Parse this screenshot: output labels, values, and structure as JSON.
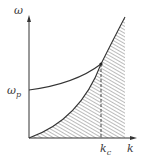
{
  "figure": {
    "type": "dispersion-diagram",
    "colors": {
      "line": "#333333",
      "hatch": "#555555",
      "background": "#ffffff"
    },
    "axes": {
      "y_label": "ω",
      "x_label": "k"
    },
    "annotations": {
      "omega_p_main": "ω",
      "omega_p_sub": "p",
      "k_c_main": "k",
      "k_c_sub": "c"
    },
    "curves": [
      {
        "name": "upper-dispersion-curve",
        "description": "starts at ω_p on ω-axis, rises to meet lower curve at k_c"
      },
      {
        "name": "lower-light-line-curve",
        "description": "starts at origin, concave up, passes through intersection at k_c"
      }
    ],
    "shaded_region": "hatched area beneath lower curve",
    "dashed_line": "vertical dashed line at k_c"
  }
}
